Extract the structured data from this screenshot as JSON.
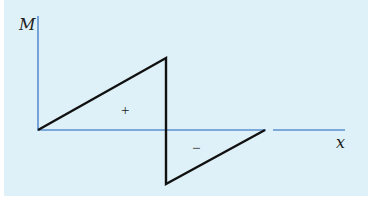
{
  "diagram": {
    "type": "bending-moment-diagram",
    "axes": {
      "y_label": "M",
      "x_label": "x",
      "axis_color": "#5b8fd0"
    },
    "curve": {
      "color": "#111111",
      "points": [
        [
          38,
          130
        ],
        [
          166,
          58
        ],
        [
          166,
          184
        ],
        [
          265,
          130
        ]
      ]
    },
    "regions": {
      "positive_label": "+",
      "negative_label": "−"
    },
    "background_color": "#dff1f8"
  }
}
